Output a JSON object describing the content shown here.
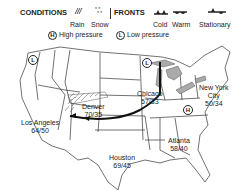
{
  "legend": {
    "conditions_title": "CONDITIONS",
    "conditions": [
      {
        "label": "Rain",
        "icon": "rain-icon"
      },
      {
        "label": "Snow",
        "icon": "snow-icon"
      }
    ],
    "fronts_title": "FRONTS",
    "fronts": [
      {
        "label": "Cold",
        "icon": "cold-front-icon"
      },
      {
        "label": "Warm",
        "icon": "warm-front-icon"
      },
      {
        "label": "Stationary",
        "icon": "stationary-front-icon"
      }
    ],
    "high_symbol": "H",
    "high_label": "High pressure",
    "low_symbol": "L",
    "low_label": "Low pressure"
  },
  "cities": [
    {
      "name": "Los Angeles",
      "temps": "64/50"
    },
    {
      "name": "Denver",
      "temps": "70/35"
    },
    {
      "name": "Chicago",
      "temps": "57/33"
    },
    {
      "name": "New York City",
      "name_line1": "New York",
      "name_line2": "City",
      "temps": "50/34"
    },
    {
      "name": "Houston",
      "temps": "69/45"
    },
    {
      "name": "Atlanta",
      "temps": "58/40"
    }
  ],
  "pressure_systems": [
    {
      "type": "L",
      "location": "Pacific Northwest"
    },
    {
      "type": "L",
      "location": "Upper Midwest"
    },
    {
      "type": "H",
      "location": "Ohio Valley"
    }
  ]
}
